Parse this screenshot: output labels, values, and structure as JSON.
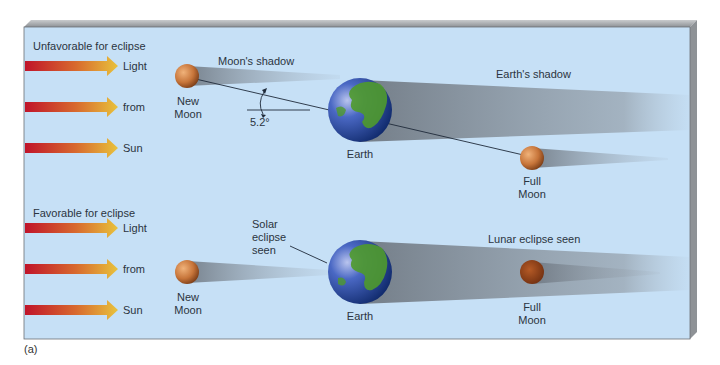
{
  "figure": {
    "caption": "(a)",
    "panels": [
      {
        "title": "Unfavorable for eclipse",
        "light_words": [
          "Light",
          "from",
          "Sun"
        ],
        "new_moon_label": [
          "New",
          "Moon"
        ],
        "moon_shadow_label": "Moon's shadow",
        "angle_label": "5.2°",
        "earth_label": "Earth",
        "earth_shadow_label": "Earth's shadow",
        "full_moon_label": [
          "Full",
          "Moon"
        ]
      },
      {
        "title": "Favorable for eclipse",
        "light_words": [
          "Light",
          "from",
          "Sun"
        ],
        "solar_label": [
          "Solar",
          "eclipse",
          "seen"
        ],
        "new_moon_label": [
          "New",
          "Moon"
        ],
        "earth_label": "Earth",
        "lunar_label": "Lunar eclipse seen",
        "full_moon_label": [
          "Full",
          "Moon"
        ]
      }
    ],
    "colors": {
      "background": "#c6e0f6",
      "frame_edge": "#8e9296",
      "arrow_start": "#c0142a",
      "arrow_end": "#e8c23c",
      "moon": "#c77a3e",
      "earth_ocean": "#2a4fa8",
      "earth_land": "#4f9a2c",
      "shadow": "#7f8891"
    }
  }
}
